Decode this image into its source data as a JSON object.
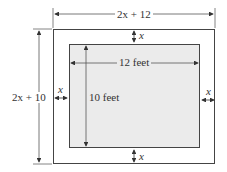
{
  "diagram": {
    "type": "dimensioned nested rectangles (frame/border around a rectangle)",
    "outer_rectangle": {
      "width_label": "2x + 12",
      "height_label": "2x + 10"
    },
    "inner_rectangle": {
      "width_label": "12 feet",
      "height_label": "10 feet",
      "fill": "#ebebeb"
    },
    "border_width_labels": {
      "top": "x",
      "bottom": "x",
      "left": "x",
      "right": "x"
    },
    "colors": {
      "line": "#444444",
      "inner_fill": "#ebebeb",
      "background": "#ffffff"
    }
  }
}
